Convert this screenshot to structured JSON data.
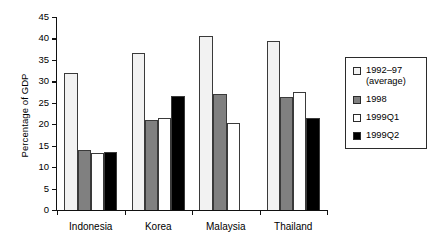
{
  "chart_data": {
    "type": "bar",
    "title": "",
    "xlabel": "",
    "ylabel": "Percentage of GDP",
    "ylim": [
      0,
      45
    ],
    "ytick_step": 5,
    "yticks": [
      "45",
      "40",
      "35",
      "30",
      "25",
      "20",
      "15",
      "10",
      "5",
      "0"
    ],
    "grid": false,
    "legend_position": "right",
    "categories": [
      "Indonesia",
      "Korea",
      "Malaysia",
      "Thailand"
    ],
    "series": [
      {
        "name": "1992–97\n(average)",
        "legend_label": "1992–97\n(average)",
        "color": "#f2f2f2",
        "values": [
          32.0,
          36.6,
          40.5,
          39.4
        ]
      },
      {
        "name": "1998",
        "legend_label": "1998",
        "color": "#808080",
        "values": [
          14.1,
          21.0,
          27.0,
          26.3
        ]
      },
      {
        "name": "1999Q1",
        "legend_label": "1999Q1",
        "color": "#ffffff",
        "values": [
          13.2,
          21.5,
          20.3,
          27.5
        ]
      },
      {
        "name": "1999Q2",
        "legend_label": "1999Q2",
        "color": "#000000",
        "values": [
          13.5,
          26.5,
          null,
          21.4
        ]
      }
    ]
  }
}
